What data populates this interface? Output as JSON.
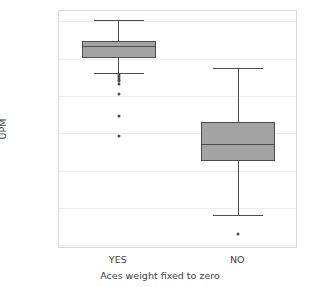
{
  "chart_data": {
    "type": "box",
    "title": "",
    "xlabel": "Aces weight fixed to zero",
    "ylabel": "UPM",
    "categories": [
      "YES",
      "NO"
    ],
    "ylim": [
      0.818,
      0.9455
    ],
    "yticks": [
      0.94,
      0.92,
      0.9,
      0.88,
      0.86,
      0.84,
      0.82
    ],
    "ytick_labels": [
      "0.94",
      "0.92",
      "0.90",
      "0.88",
      "0.86",
      "0.84",
      "0.82"
    ],
    "grid": true,
    "legend": "none",
    "box_color": "#a3a3a3",
    "line_color": "#4d4d4d",
    "grid_color": "#ededed",
    "boxes": [
      {
        "category": "YES",
        "whisker_low": 0.9125,
        "q1": 0.9205,
        "median": 0.9268,
        "q3": 0.9295,
        "whisker_high": 0.9405,
        "outliers": [
          0.9115,
          0.9105,
          0.9098,
          0.9088,
          0.9078,
          0.9065,
          0.9012,
          0.889,
          0.8785
        ]
      },
      {
        "category": "NO",
        "whisker_low": 0.836,
        "q1": 0.865,
        "median": 0.8742,
        "q3": 0.8862,
        "whisker_high": 0.9152,
        "outliers": [
          0.8262
        ]
      }
    ]
  }
}
